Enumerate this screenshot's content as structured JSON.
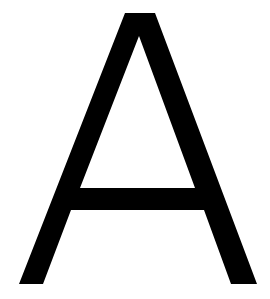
{
  "glyph": {
    "character": "A",
    "color": "#000000",
    "background": "#ffffff"
  }
}
